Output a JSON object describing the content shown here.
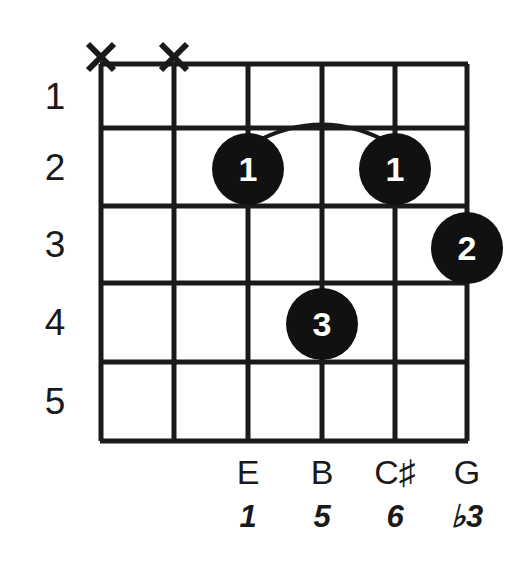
{
  "diagram": {
    "type": "guitar-chord-diagram",
    "strings": 6,
    "frets": 5,
    "ink_color": "#1a1a1a",
    "dot_fill": "#111111",
    "dot_text_color": "#ffffff",
    "background": "#ffffff",
    "fret_numbers": [
      "1",
      "2",
      "3",
      "4",
      "5"
    ],
    "muted_strings": [
      {
        "name": "x-marker-string-6",
        "label": "X"
      },
      {
        "name": "x-marker-string-5",
        "label": "X"
      }
    ],
    "finger_dots": [
      {
        "name": "finger-dot-string4-fret2",
        "label": "1",
        "string": 4,
        "fret": 2
      },
      {
        "name": "finger-dot-string2-fret2",
        "label": "1",
        "string": 2,
        "fret": 2
      },
      {
        "name": "finger-dot-string1-fret3",
        "label": "2",
        "string": 1,
        "fret": 3
      },
      {
        "name": "finger-dot-string3-fret4",
        "label": "3",
        "string": 3,
        "fret": 4
      }
    ],
    "barre": {
      "name": "barre-arc",
      "from_string": 4,
      "to_string": 2,
      "fret": 2
    },
    "note_labels": [
      {
        "string": 4,
        "note": "E",
        "interval": "1"
      },
      {
        "string": 3,
        "note": "B",
        "interval": "5"
      },
      {
        "string": 2,
        "note": "C♯",
        "interval": "6"
      },
      {
        "string": 1,
        "note": "G",
        "interval": "♭3"
      }
    ]
  }
}
